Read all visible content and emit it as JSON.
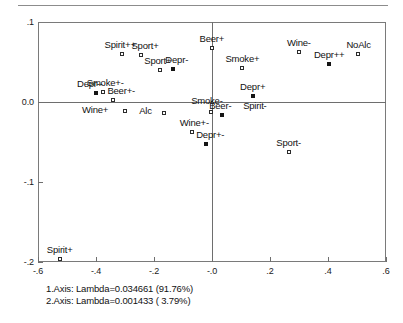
{
  "chart_data": {
    "type": "scatter",
    "title": "",
    "subtitle": "",
    "xlabel": "",
    "ylabel": "",
    "xlim": [
      -0.6,
      0.6
    ],
    "ylim": [
      -0.2,
      0.1
    ],
    "grid": false,
    "legend": "none",
    "xticks": [
      "-.6",
      "-.4",
      "-.2",
      "-.0",
      ".2",
      ".4",
      ".6"
    ],
    "xtick_values": [
      -0.6,
      -0.4,
      -0.2,
      0.0,
      0.2,
      0.4,
      0.6
    ],
    "yticks": [
      ".1",
      "0.0",
      "-.1",
      "-.2"
    ],
    "ytick_values": [
      0.1,
      0.0,
      -0.1,
      -0.2
    ],
    "marker_styles": {
      "open": "hollow-square (column points)",
      "filled": "solid-square (row points)"
    },
    "points": [
      {
        "label": "Spirit+",
        "x": -0.525,
        "y": -0.196,
        "marker": "open",
        "label_dx": 0,
        "label_dy": -9,
        "label_anchor": "center"
      },
      {
        "label": "Spirit++",
        "x": -0.31,
        "y": 0.06,
        "marker": "open",
        "label_dx": -2,
        "label_dy": -9,
        "label_anchor": "center"
      },
      {
        "label": "Sport+",
        "x": -0.245,
        "y": 0.059,
        "marker": "open",
        "label_dx": 4,
        "label_dy": -9,
        "label_anchor": "center"
      },
      {
        "label": "Sport+",
        "x": -0.18,
        "y": 0.04,
        "marker": "open",
        "label_dx": -2,
        "label_dy": -9,
        "label_anchor": "center"
      },
      {
        "label": "Depr-",
        "x": -0.135,
        "y": 0.041,
        "marker": "filled",
        "label_dx": 4,
        "label_dy": -9,
        "label_anchor": "center"
      },
      {
        "label": "Smoke+-",
        "x": -0.375,
        "y": 0.012,
        "marker": "open",
        "label_dx": 2,
        "label_dy": -9,
        "label_anchor": "center"
      },
      {
        "label": "Depr--",
        "x": -0.4,
        "y": 0.011,
        "marker": "filled",
        "label_dx": -6,
        "label_dy": -9,
        "label_anchor": "center"
      },
      {
        "label": "Beer+-",
        "x": -0.34,
        "y": 0.002,
        "marker": "open",
        "label_dx": 8,
        "label_dy": -9,
        "label_anchor": "center"
      },
      {
        "label": "Wine+",
        "x": -0.3,
        "y": -0.011,
        "marker": "open",
        "label_dx": -17,
        "label_dy": -1,
        "label_anchor": "end"
      },
      {
        "label": "Alc",
        "x": -0.165,
        "y": -0.014,
        "marker": "open",
        "label_dx": -12,
        "label_dy": -2,
        "label_anchor": "end"
      },
      {
        "label": "Beer+",
        "x": 0.0,
        "y": 0.068,
        "marker": "open",
        "label_dx": 0,
        "label_dy": -9,
        "label_anchor": "center"
      },
      {
        "label": "Smoke-",
        "x": -0.003,
        "y": -0.012,
        "marker": "open",
        "label_dx": -4,
        "label_dy": -11,
        "label_anchor": "center"
      },
      {
        "label": "Wine+-",
        "x": -0.068,
        "y": -0.038,
        "marker": "open",
        "label_dx": 2,
        "label_dy": -9,
        "label_anchor": "center"
      },
      {
        "label": "Depr+-",
        "x": -0.02,
        "y": -0.052,
        "marker": "filled",
        "label_dx": 4,
        "label_dy": -9,
        "label_anchor": "center"
      },
      {
        "label": "Beer-",
        "x": 0.035,
        "y": -0.016,
        "marker": "filled",
        "label_dx": -2,
        "label_dy": -9,
        "label_anchor": "center"
      },
      {
        "label": "Spirit-",
        "x": 0.085,
        "y": -0.016,
        "marker": "none",
        "label_dx": 18,
        "label_dy": -9,
        "label_anchor": "center"
      },
      {
        "label": "Smoke+",
        "x": 0.105,
        "y": 0.043,
        "marker": "open",
        "label_dx": 0,
        "label_dy": -9,
        "label_anchor": "center"
      },
      {
        "label": "Depr+",
        "x": 0.14,
        "y": 0.007,
        "marker": "filled",
        "label_dx": 0,
        "label_dy": -9,
        "label_anchor": "center"
      },
      {
        "label": "Wine-",
        "x": 0.3,
        "y": 0.062,
        "marker": "open",
        "label_dx": 0,
        "label_dy": -9,
        "label_anchor": "center"
      },
      {
        "label": "Depr++",
        "x": 0.405,
        "y": 0.048,
        "marker": "filled",
        "label_dx": 0,
        "label_dy": -9,
        "label_anchor": "center"
      },
      {
        "label": "NoAlc",
        "x": 0.505,
        "y": 0.06,
        "marker": "open",
        "label_dx": 0,
        "label_dy": -9,
        "label_anchor": "center"
      },
      {
        "label": "Sport-",
        "x": 0.265,
        "y": -0.062,
        "marker": "open",
        "label_dx": 0,
        "label_dy": -9,
        "label_anchor": "center"
      }
    ],
    "annotations": [
      "1.Axis: Lambda=0.034661 (91.76%)",
      "2.Axis: Lambda=0.001433 ( 3.79%)"
    ]
  },
  "caption": {
    "line1": "1.Axis: Lambda=0.034661 (91.76%)",
    "line2": "2.Axis: Lambda=0.001433 ( 3.79%)"
  }
}
